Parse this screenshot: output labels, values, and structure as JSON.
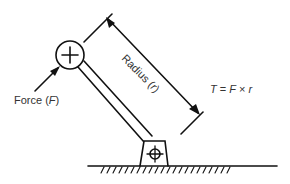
{
  "diagram": {
    "labels": {
      "force": {
        "text": "Force (",
        "symbol": "F",
        "close": ")"
      },
      "radius": {
        "text": "Radius (",
        "symbol": "r",
        "close": ")"
      },
      "torque": {
        "lhs": "T",
        "eq": " = ",
        "f": "F",
        "times": " × ",
        "r": "r"
      }
    },
    "colors": {
      "line": "#111111",
      "text": "#333333",
      "background": "#ffffff"
    }
  }
}
